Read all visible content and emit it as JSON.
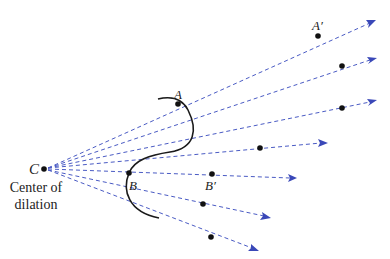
{
  "diagram": {
    "type": "dilation",
    "center": {
      "label": "C",
      "x": 44,
      "y": 169
    },
    "caption_line1": "Center of",
    "caption_line2": "dilation",
    "colors": {
      "ray": "#4a5bc4",
      "arrow": "#3a48b8",
      "curve": "#1a1a1a",
      "point": "#111111"
    },
    "rays": [
      {
        "end": [
          375,
          21
        ],
        "image_point": [
          318,
          36
        ]
      },
      {
        "end": [
          376,
          59
        ],
        "image_point": [
          342,
          66
        ]
      },
      {
        "end": [
          376,
          101
        ],
        "image_point": [
          342,
          108
        ]
      },
      {
        "end": [
          327,
          143
        ],
        "image_point": [
          260,
          148
        ]
      },
      {
        "end": [
          296,
          178
        ],
        "image_point": [
          212,
          174
        ]
      },
      {
        "end": [
          270,
          218
        ],
        "image_point": [
          203,
          204
        ]
      },
      {
        "end": [
          258,
          250
        ],
        "image_point": [
          211,
          237
        ]
      }
    ],
    "points": {
      "A": {
        "label": "A",
        "x": 178,
        "y": 104
      },
      "A_prime": {
        "label": "A'",
        "x": 318,
        "y": 36
      },
      "B": {
        "label": "B",
        "x": 129,
        "y": 173
      },
      "B_prime": {
        "label": "B'",
        "x": 212,
        "y": 174
      }
    },
    "labels": {
      "C": "C",
      "A": "A",
      "A_prime": "A′",
      "B": "B",
      "B_prime": "B′"
    }
  }
}
